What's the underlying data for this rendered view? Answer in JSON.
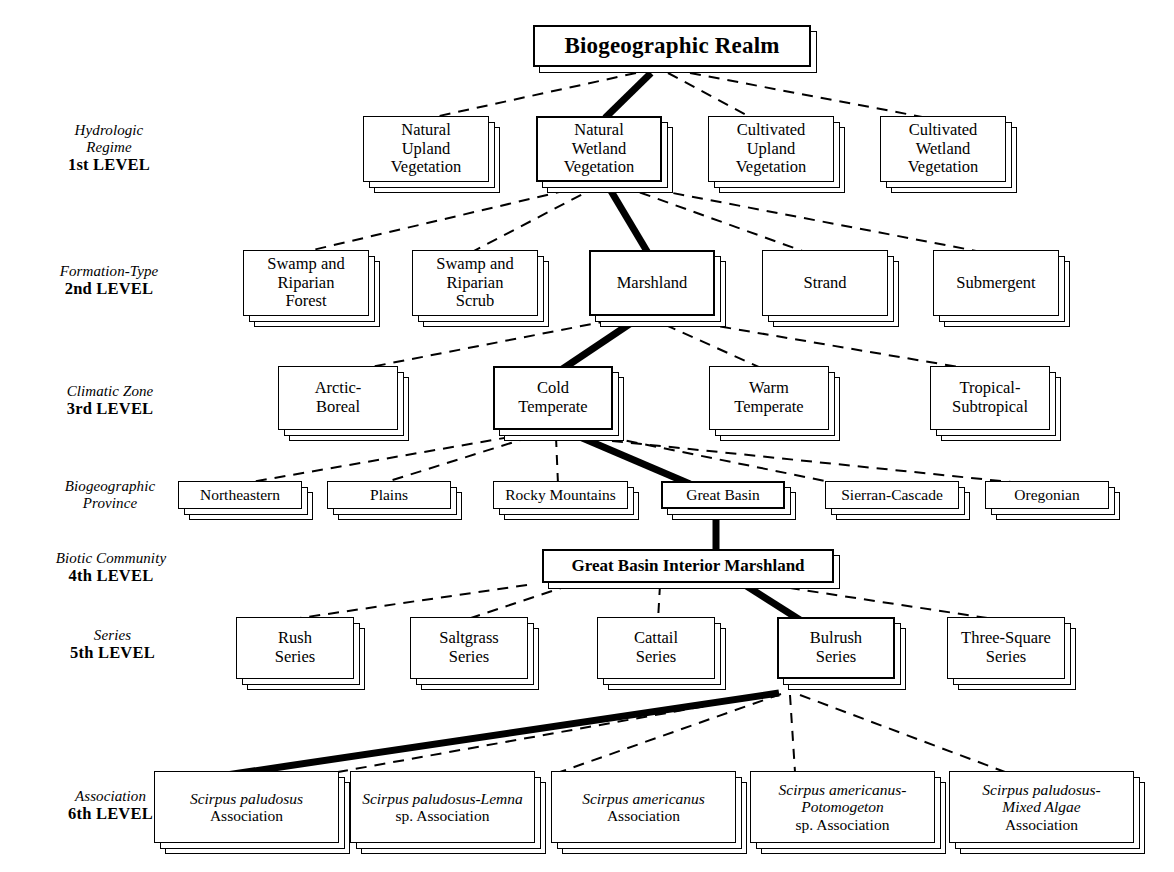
{
  "diagram": {
    "title": "Biogeographic Realm",
    "kind": "hierarchical-classification-tree",
    "link_styles": {
      "dashed": "normal branch",
      "bold": "highlighted example pathway"
    },
    "colors": {
      "ink": "#000000",
      "paper": "#ffffff"
    }
  },
  "level_labels": [
    {
      "name": "Hydrologic\nRegime",
      "name_line1": "Hydrologic",
      "name_line2": "Regime",
      "rank": "1st LEVEL"
    },
    {
      "name": "Formation-Type",
      "name_line1": "Formation-Type",
      "name_line2": "",
      "rank": "2nd LEVEL"
    },
    {
      "name": "Climatic Zone",
      "name_line1": "Climatic Zone",
      "name_line2": "",
      "rank": "3rd LEVEL"
    },
    {
      "name": "Biogeographic Province",
      "name_line1": "Biogeographic",
      "name_line2": "Province",
      "rank": ""
    },
    {
      "name": "Biotic Community",
      "name_line1": "Biotic Community",
      "name_line2": "",
      "rank": "4th LEVEL"
    },
    {
      "name": "Series",
      "name_line1": "Series",
      "name_line2": "",
      "rank": "5th LEVEL"
    },
    {
      "name": "Association",
      "name_line1": "Association",
      "name_line2": "",
      "rank": "6th LEVEL"
    }
  ],
  "root": {
    "label": "Biogeographic Realm"
  },
  "level1": {
    "caption": "Hydrologic Regime",
    "nodes": [
      {
        "l1": "Natural",
        "l2": "Upland",
        "l3": "Vegetation",
        "highlighted": false
      },
      {
        "l1": "Natural",
        "l2": "Wetland",
        "l3": "Vegetation",
        "highlighted": true
      },
      {
        "l1": "Cultivated",
        "l2": "Upland",
        "l3": "Vegetation",
        "highlighted": false
      },
      {
        "l1": "Cultivated",
        "l2": "Wetland",
        "l3": "Vegetation",
        "highlighted": false
      }
    ]
  },
  "level2": {
    "caption": "Formation-Type",
    "nodes": [
      {
        "l1": "Swamp and",
        "l2": "Riparian",
        "l3": "Forest",
        "highlighted": false
      },
      {
        "l1": "Swamp and",
        "l2": "Riparian",
        "l3": "Scrub",
        "highlighted": false
      },
      {
        "l1": "Marshland",
        "l2": "",
        "l3": "",
        "highlighted": true
      },
      {
        "l1": "Strand",
        "l2": "",
        "l3": "",
        "highlighted": false
      },
      {
        "l1": "Submergent",
        "l2": "",
        "l3": "",
        "highlighted": false
      }
    ]
  },
  "level3": {
    "caption": "Climatic Zone",
    "nodes": [
      {
        "l1": "Arctic-",
        "l2": "Boreal",
        "highlighted": false
      },
      {
        "l1": "Cold",
        "l2": "Temperate",
        "highlighted": true
      },
      {
        "l1": "Warm",
        "l2": "Temperate",
        "highlighted": false
      },
      {
        "l1": "Tropical-",
        "l2": "Subtropical",
        "highlighted": false
      }
    ]
  },
  "province": {
    "caption": "Biogeographic Province",
    "nodes": [
      {
        "label": "Northeastern",
        "highlighted": false
      },
      {
        "label": "Plains",
        "highlighted": false
      },
      {
        "label": "Rocky Mountains",
        "highlighted": false
      },
      {
        "label": "Great Basin",
        "highlighted": true
      },
      {
        "label": "Sierran-Cascade",
        "highlighted": false
      },
      {
        "label": "Oregonian",
        "highlighted": false
      }
    ]
  },
  "level4": {
    "caption": "Biotic Community",
    "nodes": [
      {
        "label": "Great Basin Interior Marshland",
        "highlighted": true
      }
    ]
  },
  "level5": {
    "caption": "Series",
    "nodes": [
      {
        "l1": "Rush",
        "l2": "Series",
        "highlighted": false
      },
      {
        "l1": "Saltgrass",
        "l2": "Series",
        "highlighted": false
      },
      {
        "l1": "Cattail",
        "l2": "Series",
        "highlighted": false
      },
      {
        "l1": "Bulrush",
        "l2": "Series",
        "highlighted": true
      },
      {
        "l1": "Three-Square",
        "l2": "Series",
        "highlighted": false
      }
    ]
  },
  "level6": {
    "caption": "Association",
    "nodes": [
      {
        "sci1": "Scirpus paludosus",
        "sci2": "",
        "plain": "Association",
        "highlighted": true
      },
      {
        "sci1": "Scirpus paludosus-Lemna",
        "sci2": "",
        "plain": "sp. Association",
        "highlighted": false
      },
      {
        "sci1": "Scirpus americanus",
        "sci2": "",
        "plain": "Association",
        "highlighted": false
      },
      {
        "sci1": "Scirpus americanus-",
        "sci2": "Potomogeton",
        "plain": "sp. Association",
        "highlighted": false
      },
      {
        "sci1": "Scirpus paludosus-",
        "sci2": "Mixed Algae",
        "plain": "Association",
        "highlighted": false
      }
    ]
  }
}
